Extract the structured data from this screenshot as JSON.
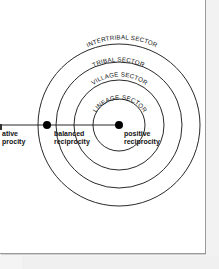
{
  "diagram": {
    "type": "concentric-sectors",
    "center": {
      "x": 119,
      "y": 125
    },
    "sectors": [
      {
        "label": "LINEAGE SECTOR",
        "radius": 26
      },
      {
        "label": "VILLAGE SECTOR",
        "radius": 45
      },
      {
        "label": "TRIBAL SECTOR",
        "radius": 63
      },
      {
        "label": "INTERTRIBAL SECTOR",
        "radius": 81
      }
    ],
    "axis": {
      "nodes": [
        {
          "label_line1": "negative",
          "label_line2": "reciprocity",
          "visible_line1": "ative",
          "visible_line2": "procity",
          "x": 0
        },
        {
          "label_line1": "balanced",
          "label_line2": "reciprocity",
          "x": 47
        },
        {
          "label_line1": "positive",
          "label_line2": "reciprocity",
          "x": 119
        }
      ]
    }
  }
}
